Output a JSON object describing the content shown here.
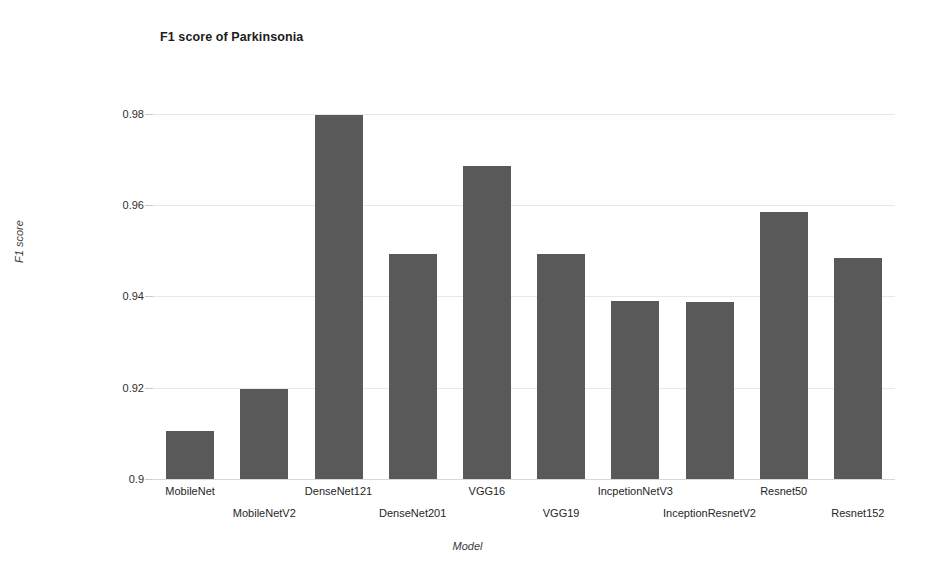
{
  "chart_data": {
    "type": "bar",
    "title": "F1 score of Parkinsonia",
    "xlabel": "Model",
    "ylabel": "F1 score",
    "categories": [
      "MobileNet",
      "MobileNetV2",
      "DenseNet121",
      "DenseNet201",
      "VGG16",
      "VGG19",
      "IncpetionNetV3",
      "InceptionResnetV2",
      "Resnet50",
      "Resnet152"
    ],
    "values": [
      0.9105,
      0.9198,
      0.9798,
      0.9492,
      0.9685,
      0.9492,
      0.939,
      0.9388,
      0.9585,
      0.9483
    ],
    "ylim": [
      0.9,
      0.99
    ],
    "yticks": [
      0.9,
      0.92,
      0.94,
      0.96,
      0.98
    ],
    "ytick_labels": [
      "0.9",
      "0.92",
      "0.94",
      "0.96",
      "0.98"
    ],
    "grid": true,
    "legend": false,
    "bar_color": "#595959",
    "grid_color": "#e8e8e8",
    "background_color": "#ffffff"
  }
}
